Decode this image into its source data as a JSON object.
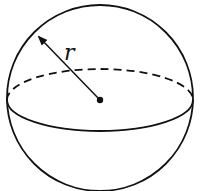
{
  "figure": {
    "radius_label": "r",
    "stroke_color": "#111111",
    "background": "#ffffff",
    "elements": {
      "outline": "sphere-outline-circle",
      "equator_front": "solid-lower-half-ellipse",
      "equator_back": "dashed-upper-half-ellipse",
      "center": "center-point",
      "radius": "radius-arrow"
    }
  }
}
